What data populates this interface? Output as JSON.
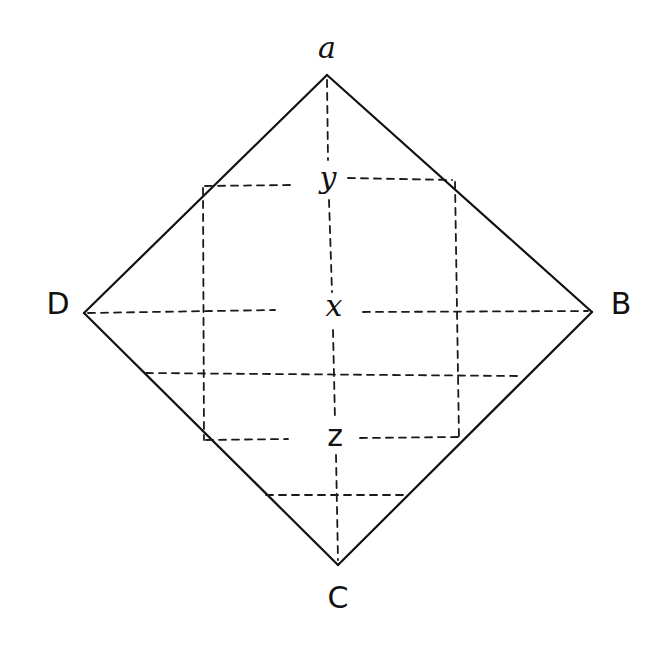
{
  "diagram": {
    "type": "square-with-grid",
    "vertices": [
      {
        "id": "A",
        "label": "a",
        "x": 327,
        "y": 75,
        "label_x": 327,
        "label_y": 50
      },
      {
        "id": "B",
        "label": "B",
        "x": 592,
        "y": 312,
        "label_x": 621,
        "label_y": 304
      },
      {
        "id": "C",
        "label": "C",
        "x": 338,
        "y": 565,
        "label_x": 338,
        "label_y": 598
      },
      {
        "id": "D",
        "label": "D",
        "x": 84,
        "y": 313,
        "label_x": 58,
        "label_y": 304
      }
    ],
    "interior_points": [
      {
        "id": "Y",
        "label": "y",
        "x": 328,
        "y": 180
      },
      {
        "id": "X",
        "label": "x",
        "x": 334,
        "y": 309
      },
      {
        "id": "Z",
        "label": "z",
        "x": 335,
        "y": 436
      }
    ],
    "outline_color": "#111111",
    "dash_color": "#1a1a1a"
  }
}
